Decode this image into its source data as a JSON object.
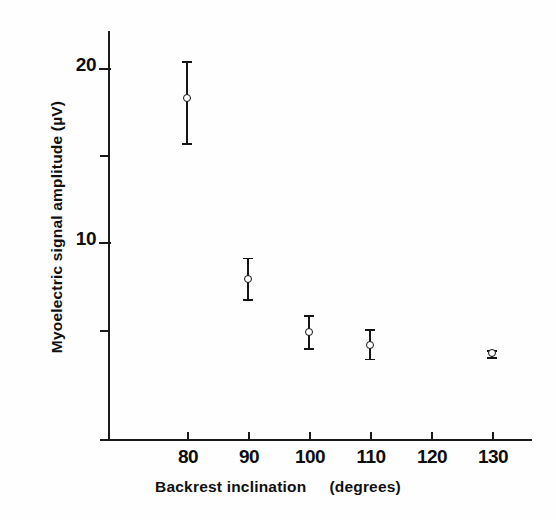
{
  "chart_data": {
    "type": "scatter",
    "title": "",
    "xlabel": "Backrest inclination   (degrees)",
    "ylabel": "Myoelectric signal amplitude (µV)",
    "x": [
      80,
      90,
      100,
      110,
      130
    ],
    "values": [
      18.3,
      7.9,
      4.8,
      4.1,
      3.6
    ],
    "error_low": [
      2.6,
      1.2,
      0.9,
      0.8,
      0.2
    ],
    "error_high": [
      2.1,
      1.2,
      1.0,
      0.9,
      0.2
    ],
    "xlim": [
      75,
      135
    ],
    "ylim": [
      0.5,
      22.1
    ],
    "xticks": [
      80,
      90,
      100,
      110,
      120,
      130
    ],
    "xtick_labels": [
      "80",
      "90",
      "100",
      "110",
      "120",
      "130"
    ],
    "yticks": [
      5,
      10,
      15,
      20
    ],
    "ytick_labels": [
      "",
      "10",
      "",
      "20"
    ],
    "ytick_major": [
      10,
      20
    ],
    "grid": false,
    "legend": null,
    "marker": "open-circle",
    "errorbars": true,
    "series_color": "#151515"
  },
  "axes": {
    "y_title": "Myoelectric signal amplitude (µV)",
    "x_title_main": "Backrest inclination",
    "x_title_unit": "(degrees)"
  }
}
